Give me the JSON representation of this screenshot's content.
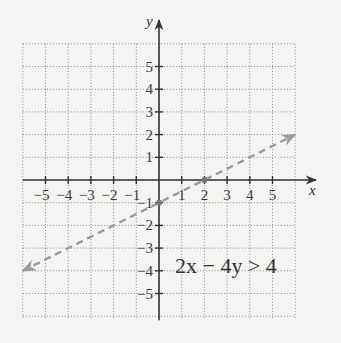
{
  "chart_data": {
    "type": "line",
    "title": "",
    "xlabel": "x",
    "ylabel": "y",
    "xlim": [
      -6,
      6
    ],
    "ylim": [
      -6,
      6
    ],
    "grid": true,
    "grid_style": "dotted",
    "x_ticks": [
      -5,
      -4,
      -3,
      -2,
      -1,
      1,
      2,
      3,
      4,
      5
    ],
    "y_ticks": [
      5,
      4,
      3,
      2,
      1,
      -1,
      -2,
      -3,
      -4,
      -5
    ],
    "x_tick_labels": [
      "−5",
      "−4",
      "−3",
      "−2",
      "−1",
      "1",
      "2",
      "3",
      "4",
      "5"
    ],
    "y_tick_labels": [
      "5",
      "4",
      "3",
      "2",
      "1",
      "−1",
      "−2",
      "−3",
      "−4",
      "−5"
    ],
    "series": [
      {
        "name": "boundary line 2x − 4y = 4",
        "style": "dashed",
        "arrows": "both",
        "color": "#9a9a9a",
        "equation": "y = x/2 - 1",
        "x": [
          -6,
          6
        ],
        "y": [
          -4,
          2
        ],
        "marked_points": [
          [
            2,
            0
          ],
          [
            0,
            -1
          ]
        ]
      }
    ],
    "annotations": [
      {
        "text": "2x − 4y > 4",
        "x": 3.5,
        "y": -3.5
      }
    ]
  },
  "labels": {
    "x_axis": "x",
    "y_axis": "y",
    "inequality": "2x − 4y > 4"
  },
  "colors": {
    "background": "#f4f4f2",
    "axis": "#333333",
    "grid": "#9c9c9c",
    "boundary": "#9a9a9a"
  }
}
